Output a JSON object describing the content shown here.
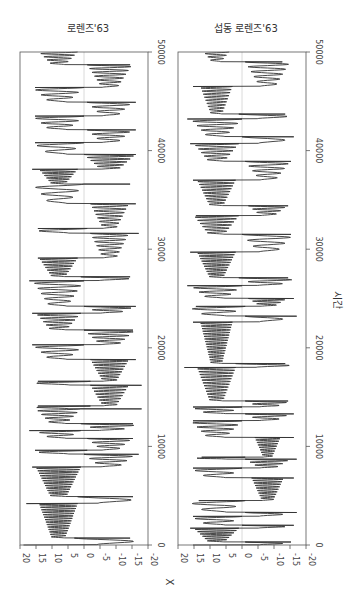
{
  "chart_data": [
    {
      "type": "line",
      "title": "로렌즈'63",
      "orientation": "rotated-90 (time on vertical axis, X on horizontal axis)",
      "xlabel": "X",
      "ylabel": "시간",
      "x_range": [
        20,
        -20
      ],
      "x_ticks": [
        20,
        15,
        10,
        5,
        0,
        -5,
        -10,
        -15,
        -20
      ],
      "time_range": [
        0,
        50000
      ],
      "time_ticks": [
        0,
        10000,
        20000,
        30000,
        40000,
        50000
      ],
      "zero_gridline": true,
      "series": [
        {
          "name": "X",
          "color": "#333333",
          "regimes": [
            {
              "t0": 0,
              "t1": 700,
              "side": -1,
              "amp": 19,
              "n": 1
            },
            {
              "t0": 700,
              "t1": 4200,
              "side": 1,
              "amp": 14,
              "n": 14
            },
            {
              "t0": 4200,
              "t1": 4900,
              "side": -1,
              "amp": 18,
              "n": 1
            },
            {
              "t0": 4900,
              "t1": 7900,
              "side": 1,
              "amp": 15,
              "n": 12
            },
            {
              "t0": 7900,
              "t1": 9200,
              "side": -1,
              "amp": 16,
              "n": 3
            },
            {
              "t0": 9200,
              "t1": 9600,
              "side": 1,
              "amp": 17,
              "n": 1
            },
            {
              "t0": 9600,
              "t1": 10800,
              "side": -1,
              "amp": 15,
              "n": 3
            },
            {
              "t0": 10800,
              "t1": 11600,
              "side": 1,
              "amp": 15,
              "n": 2
            },
            {
              "t0": 11600,
              "t1": 12300,
              "side": -1,
              "amp": 17,
              "n": 2
            },
            {
              "t0": 12300,
              "t1": 13800,
              "side": 1,
              "amp": 15,
              "n": 4
            },
            {
              "t0": 13800,
              "t1": 14100,
              "side": 1,
              "amp": 18,
              "n": 1
            },
            {
              "t0": 14100,
              "t1": 16200,
              "side": -1,
              "amp": 14,
              "n": 7
            },
            {
              "t0": 16200,
              "t1": 16600,
              "side": 1,
              "amp": 18,
              "n": 1
            },
            {
              "t0": 16600,
              "t1": 18800,
              "side": -1,
              "amp": 14,
              "n": 8
            },
            {
              "t0": 18800,
              "t1": 20300,
              "side": 1,
              "amp": 16,
              "n": 3
            },
            {
              "t0": 20300,
              "t1": 21800,
              "side": -1,
              "amp": 16,
              "n": 4
            },
            {
              "t0": 21800,
              "t1": 23500,
              "side": 1,
              "amp": 15,
              "n": 5
            },
            {
              "t0": 23500,
              "t1": 24200,
              "side": -1,
              "amp": 16,
              "n": 2
            },
            {
              "t0": 24200,
              "t1": 26800,
              "side": 1,
              "amp": 16,
              "n": 5
            },
            {
              "t0": 26800,
              "t1": 27200,
              "side": -1,
              "amp": 17,
              "n": 1
            },
            {
              "t0": 27200,
              "t1": 29100,
              "side": 1,
              "amp": 14,
              "n": 7
            },
            {
              "t0": 29100,
              "t1": 31600,
              "side": -1,
              "amp": 14,
              "n": 6
            },
            {
              "t0": 31600,
              "t1": 32100,
              "side": 1,
              "amp": 17,
              "n": 1
            },
            {
              "t0": 32100,
              "t1": 34600,
              "side": -1,
              "amp": 14,
              "n": 7
            },
            {
              "t0": 34600,
              "t1": 36600,
              "side": 1,
              "amp": 16,
              "n": 3
            },
            {
              "t0": 36600,
              "t1": 38100,
              "side": 1,
              "amp": 14,
              "n": 6
            },
            {
              "t0": 38100,
              "t1": 39600,
              "side": -1,
              "amp": 16,
              "n": 5
            },
            {
              "t0": 39600,
              "t1": 40800,
              "side": 1,
              "amp": 16,
              "n": 2
            },
            {
              "t0": 40800,
              "t1": 42100,
              "side": -1,
              "amp": 15,
              "n": 3
            },
            {
              "t0": 42100,
              "t1": 43500,
              "side": 1,
              "amp": 16,
              "n": 3
            },
            {
              "t0": 43500,
              "t1": 44900,
              "side": -1,
              "amp": 15,
              "n": 3
            },
            {
              "t0": 44900,
              "t1": 46400,
              "side": 1,
              "amp": 16,
              "n": 3
            },
            {
              "t0": 46400,
              "t1": 48700,
              "side": -1,
              "amp": 15,
              "n": 6
            },
            {
              "t0": 48700,
              "t1": 50000,
              "side": 1,
              "amp": 14,
              "n": 4
            }
          ]
        }
      ]
    },
    {
      "type": "line",
      "title": "섭동 로렌즈'63",
      "orientation": "rotated-90 (time on vertical axis, X on horizontal axis)",
      "xlabel": "",
      "ylabel": "시간",
      "x_range": [
        20,
        -20
      ],
      "x_ticks": [
        20,
        15,
        10,
        5,
        0,
        -5,
        -10,
        -15,
        -20
      ],
      "time_range": [
        0,
        50000
      ],
      "time_ticks": [
        0,
        10000,
        20000,
        30000,
        40000,
        50000
      ],
      "zero_gridline": true,
      "series": [
        {
          "name": "X",
          "color": "#333333",
          "regimes": [
            {
              "t0": 0,
              "t1": 300,
              "side": -1,
              "amp": 15,
              "n": 1
            },
            {
              "t0": 300,
              "t1": 1700,
              "side": 1,
              "amp": 15,
              "n": 6
            },
            {
              "t0": 1700,
              "t1": 2000,
              "side": -1,
              "amp": 16,
              "n": 1
            },
            {
              "t0": 2000,
              "t1": 2900,
              "side": 1,
              "amp": 16,
              "n": 2
            },
            {
              "t0": 2900,
              "t1": 3300,
              "side": -1,
              "amp": 15,
              "n": 1
            },
            {
              "t0": 3300,
              "t1": 4500,
              "side": 1,
              "amp": 17,
              "n": 2
            },
            {
              "t0": 4500,
              "t1": 6800,
              "side": -1,
              "amp": 13,
              "n": 9
            },
            {
              "t0": 6800,
              "t1": 7800,
              "side": 1,
              "amp": 16,
              "n": 2
            },
            {
              "t0": 7800,
              "t1": 8700,
              "side": -1,
              "amp": 15,
              "n": 3
            },
            {
              "t0": 8700,
              "t1": 8900,
              "side": 1,
              "amp": 17,
              "n": 1
            },
            {
              "t0": 8900,
              "t1": 10900,
              "side": -1,
              "amp": 12,
              "n": 8
            },
            {
              "t0": 10900,
              "t1": 12600,
              "side": 1,
              "amp": 16,
              "n": 4
            },
            {
              "t0": 12600,
              "t1": 13300,
              "side": -1,
              "amp": 15,
              "n": 2
            },
            {
              "t0": 13300,
              "t1": 14000,
              "side": 1,
              "amp": 16,
              "n": 2
            },
            {
              "t0": 14000,
              "t1": 14600,
              "side": -1,
              "amp": 15,
              "n": 2
            },
            {
              "t0": 14600,
              "t1": 18000,
              "side": 1,
              "amp": 14,
              "n": 12
            },
            {
              "t0": 18000,
              "t1": 18400,
              "side": -1,
              "amp": 18,
              "n": 1
            },
            {
              "t0": 18400,
              "t1": 22600,
              "side": 1,
              "amp": 13,
              "n": 16
            },
            {
              "t0": 22600,
              "t1": 23200,
              "side": -1,
              "amp": 15,
              "n": 1
            },
            {
              "t0": 23200,
              "t1": 24200,
              "side": 1,
              "amp": 17,
              "n": 2
            },
            {
              "t0": 24200,
              "t1": 25000,
              "side": -1,
              "amp": 14,
              "n": 3
            },
            {
              "t0": 25000,
              "t1": 26300,
              "side": 1,
              "amp": 16,
              "n": 3
            },
            {
              "t0": 26300,
              "t1": 27100,
              "side": -1,
              "amp": 17,
              "n": 2
            },
            {
              "t0": 27100,
              "t1": 29700,
              "side": 1,
              "amp": 14,
              "n": 10
            },
            {
              "t0": 29700,
              "t1": 31500,
              "side": -1,
              "amp": 16,
              "n": 3
            },
            {
              "t0": 31500,
              "t1": 33400,
              "side": 1,
              "amp": 15,
              "n": 6
            },
            {
              "t0": 33400,
              "t1": 34400,
              "side": -1,
              "amp": 14,
              "n": 3
            },
            {
              "t0": 34400,
              "t1": 37000,
              "side": 1,
              "amp": 14,
              "n": 9
            },
            {
              "t0": 37000,
              "t1": 38900,
              "side": -1,
              "amp": 15,
              "n": 4
            },
            {
              "t0": 38900,
              "t1": 40700,
              "side": 1,
              "amp": 15,
              "n": 5
            },
            {
              "t0": 40700,
              "t1": 41400,
              "side": -1,
              "amp": 16,
              "n": 1
            },
            {
              "t0": 41400,
              "t1": 43200,
              "side": 1,
              "amp": 16,
              "n": 4
            },
            {
              "t0": 43200,
              "t1": 43700,
              "side": -1,
              "amp": 17,
              "n": 1
            },
            {
              "t0": 43700,
              "t1": 46500,
              "side": 1,
              "amp": 13,
              "n": 9
            },
            {
              "t0": 46500,
              "t1": 49000,
              "side": -1,
              "amp": 15,
              "n": 5
            },
            {
              "t0": 49000,
              "t1": 50000,
              "side": 1,
              "amp": 12,
              "n": 3
            }
          ]
        }
      ]
    }
  ],
  "panels": [
    {
      "title": "로렌즈'63",
      "left": 20,
      "right": 148
    },
    {
      "title": "섭동 로렌즈'63",
      "left": 178,
      "right": 306
    }
  ],
  "axes": {
    "x_label": "X",
    "time_label": "시간",
    "x_tick_labels": [
      "20",
      "15",
      "10",
      "5",
      "0",
      "-5",
      "-10",
      "-15",
      "-20"
    ],
    "time_tick_labels": [
      "0",
      "10000",
      "20000",
      "30000",
      "40000",
      "50000"
    ]
  },
  "layout": {
    "top": 52,
    "bottom": 545
  },
  "colors": {
    "line": "#333333",
    "frame": "#555555",
    "grid": "#d0d0d0",
    "text": "#444444"
  }
}
